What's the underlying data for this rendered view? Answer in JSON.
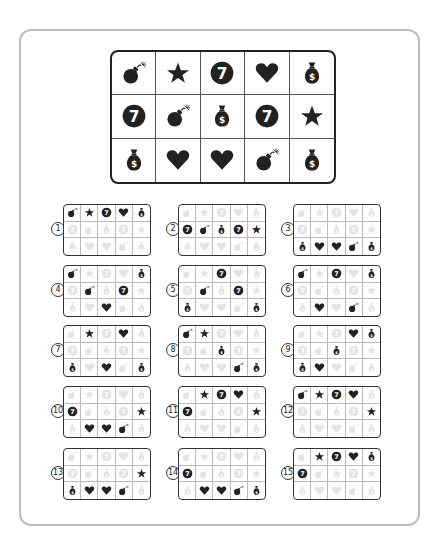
{
  "puzzle": {
    "main_grid": [
      [
        "bomb",
        "star",
        "seven",
        "heart",
        "money"
      ],
      [
        "seven",
        "bomb",
        "money",
        "seven",
        "star"
      ],
      [
        "money",
        "heart",
        "heart",
        "bomb",
        "money"
      ]
    ],
    "icon_legend": {
      "bomb": "bomb-icon",
      "star": "star-icon",
      "seven": "seven-coin-icon",
      "heart": "heart-icon",
      "money": "money-bag-icon"
    },
    "options": [
      {
        "number": "①",
        "label": "1",
        "revealed": [
          [
            0,
            0
          ],
          [
            0,
            1
          ],
          [
            0,
            2
          ],
          [
            0,
            3
          ],
          [
            0,
            4
          ]
        ]
      },
      {
        "number": "②",
        "label": "2",
        "revealed": [
          [
            1,
            0
          ],
          [
            1,
            1
          ],
          [
            1,
            2
          ],
          [
            1,
            3
          ],
          [
            1,
            4
          ]
        ]
      },
      {
        "number": "③",
        "label": "3",
        "revealed": [
          [
            2,
            0
          ],
          [
            2,
            1
          ],
          [
            2,
            2
          ],
          [
            2,
            3
          ],
          [
            2,
            4
          ]
        ]
      },
      {
        "number": "④",
        "label": "4",
        "revealed": [
          [
            0,
            0
          ],
          [
            0,
            4
          ],
          [
            1,
            1
          ],
          [
            1,
            3
          ],
          [
            2,
            2
          ]
        ]
      },
      {
        "number": "⑤",
        "label": "5",
        "revealed": [
          [
            0,
            2
          ],
          [
            1,
            1
          ],
          [
            1,
            3
          ],
          [
            2,
            0
          ],
          [
            2,
            4
          ]
        ]
      },
      {
        "number": "⑥",
        "label": "6",
        "revealed": [
          [
            0,
            0
          ],
          [
            0,
            2
          ],
          [
            0,
            4
          ],
          [
            2,
            1
          ],
          [
            2,
            3
          ]
        ]
      },
      {
        "number": "⑦",
        "label": "7",
        "revealed": [
          [
            0,
            1
          ],
          [
            0,
            3
          ],
          [
            2,
            0
          ],
          [
            2,
            2
          ],
          [
            2,
            4
          ]
        ]
      },
      {
        "number": "⑧",
        "label": "8",
        "revealed": [
          [
            0,
            0
          ],
          [
            0,
            1
          ],
          [
            1,
            2
          ],
          [
            2,
            3
          ],
          [
            2,
            4
          ]
        ]
      },
      {
        "number": "⑨",
        "label": "9",
        "revealed": [
          [
            0,
            3
          ],
          [
            0,
            4
          ],
          [
            1,
            2
          ],
          [
            2,
            0
          ],
          [
            2,
            1
          ]
        ]
      },
      {
        "number": "⑩",
        "label": "10",
        "revealed": [
          [
            1,
            0
          ],
          [
            1,
            4
          ],
          [
            2,
            1
          ],
          [
            2,
            2
          ],
          [
            2,
            3
          ]
        ]
      },
      {
        "number": "⑪",
        "label": "11",
        "revealed": [
          [
            0,
            1
          ],
          [
            0,
            2
          ],
          [
            0,
            3
          ],
          [
            1,
            0
          ],
          [
            1,
            4
          ]
        ]
      },
      {
        "number": "⑫",
        "label": "12",
        "revealed": [
          [
            0,
            0
          ],
          [
            0,
            1
          ],
          [
            0,
            2
          ],
          [
            0,
            3
          ],
          [
            1,
            4
          ]
        ]
      },
      {
        "number": "⑬",
        "label": "13",
        "revealed": [
          [
            1,
            4
          ],
          [
            2,
            0
          ],
          [
            2,
            1
          ],
          [
            2,
            2
          ],
          [
            2,
            3
          ]
        ]
      },
      {
        "number": "⑭",
        "label": "14",
        "revealed": [
          [
            1,
            0
          ],
          [
            2,
            1
          ],
          [
            2,
            2
          ],
          [
            2,
            3
          ],
          [
            2,
            4
          ]
        ]
      },
      {
        "number": "⑮",
        "label": "15",
        "revealed": [
          [
            0,
            1
          ],
          [
            0,
            2
          ],
          [
            0,
            3
          ],
          [
            0,
            4
          ],
          [
            1,
            0
          ]
        ]
      }
    ]
  },
  "colors": {
    "icon": "#222222",
    "frame_border": "#bdbdbd",
    "grid_border": "#222222"
  }
}
